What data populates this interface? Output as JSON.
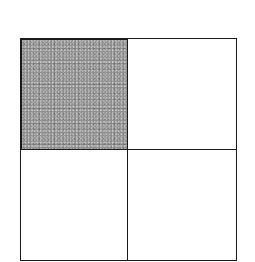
{
  "diagram": {
    "type": "2x2 grid",
    "rows": 2,
    "cols": 2,
    "cells": [
      {
        "row": 0,
        "col": 0,
        "shaded": true,
        "fill": "#8a8a8a"
      },
      {
        "row": 0,
        "col": 1,
        "shaded": false,
        "fill": "#ffffff"
      },
      {
        "row": 1,
        "col": 0,
        "shaded": false,
        "fill": "#ffffff"
      },
      {
        "row": 1,
        "col": 1,
        "shaded": false,
        "fill": "#ffffff"
      }
    ],
    "line_color": "#1a1a1a"
  }
}
